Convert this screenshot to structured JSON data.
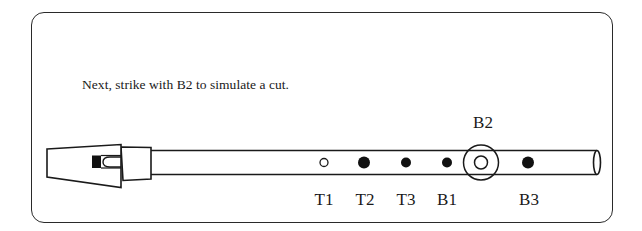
{
  "instruction": "Next, strike with B2 to simulate a cut.",
  "whistle": {
    "holes": [
      {
        "id": "T1",
        "label": "T1",
        "state": "open",
        "x": 324
      },
      {
        "id": "T2",
        "label": "T2",
        "state": "covered",
        "x": 364
      },
      {
        "id": "T3",
        "label": "T3",
        "state": "covered",
        "x": 406
      },
      {
        "id": "B1",
        "label": "B1",
        "state": "covered",
        "x": 447
      },
      {
        "id": "B2",
        "label": "B2",
        "state": "open-highlighted",
        "x": 483
      },
      {
        "id": "B3",
        "label": "B3",
        "state": "covered",
        "x": 499
      }
    ],
    "highlighted_hole": "B2"
  },
  "labels": {
    "T1": "T1",
    "T2": "T2",
    "T3": "T3",
    "B1": "B1",
    "B2": "B2",
    "B3": "B3"
  },
  "colors": {
    "line": "#1a1a1a",
    "background": "#ffffff"
  }
}
